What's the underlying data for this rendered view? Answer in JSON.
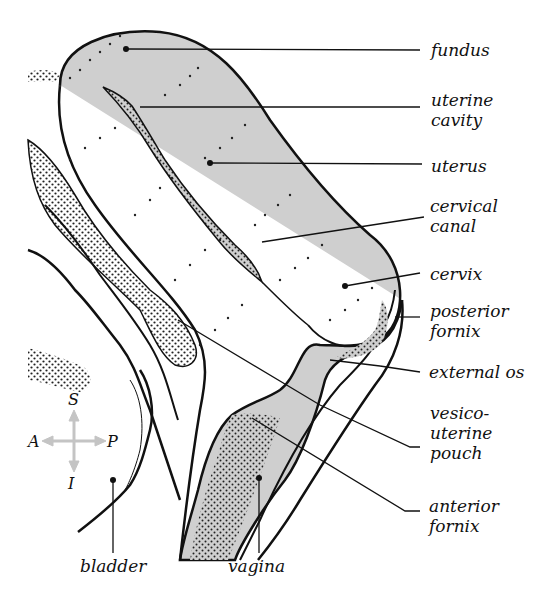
{
  "figure": {
    "colors": {
      "tissue_fill": "#cfcfcf",
      "outline": "#111111",
      "dots": "#222222",
      "compass": "#c4c4c4",
      "background": "#ffffff"
    }
  },
  "labels": {
    "fundus": "fundus",
    "uterine_cavity": "uterine\ncavity",
    "uterus": "uterus",
    "cervical_canal": "cervical\ncanal",
    "cervix": "cervix",
    "posterior_fornix": "posterior\nfornix",
    "external_os": "external os",
    "vesico_uterine_pouch": "vesico-\nuterine\npouch",
    "anterior_fornix": "anterior\nfornix",
    "bladder": "bladder",
    "vagina": "vagina"
  },
  "compass": {
    "up": "S",
    "down": "I",
    "left": "A",
    "right": "P"
  }
}
